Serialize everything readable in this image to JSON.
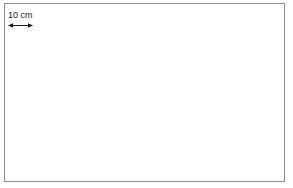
{
  "figure": {
    "width": 293,
    "height": 188,
    "background_color": "#ffffff",
    "frame_color": "#8d8d8d"
  },
  "grid": {
    "type": "graph-paper",
    "major_cell_px": 12.52,
    "minor_cell_px": 3.13,
    "minor_per_major": 4,
    "major_line_color": "#606060",
    "minor_line_color": "#969696",
    "columns_major": 22,
    "rows_major": 14
  },
  "scale": {
    "label": "10 cm",
    "arrow_icon": "double-headed-arrow-icon",
    "span_major_cells": 2
  },
  "shapes": [
    {
      "name": "tall-dark-rectangle",
      "fill": "dark",
      "fill_color": "#969696",
      "x": 55,
      "y": 3,
      "width": 94,
      "height": 179,
      "width_cells": 7.5,
      "height_cells": 14
    },
    {
      "name": "right-dark-rectangle",
      "fill": "dark",
      "fill_color": "#969696",
      "x": 198,
      "y": 53,
      "width": 87,
      "height": 76,
      "width_cells": 7,
      "height_cells": 6
    },
    {
      "name": "outlined-light-rectangle",
      "fill": "light",
      "fill_color": "#cdcdcd",
      "outline_color": "#4a4a4a",
      "x": 9,
      "y": 53,
      "width": 176,
      "height": 76,
      "width_cells": 14,
      "height_cells": 6
    }
  ]
}
